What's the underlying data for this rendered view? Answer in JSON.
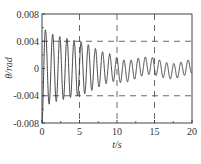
{
  "chart_data": {
    "type": "line",
    "title": "",
    "xlabel": "t/s",
    "ylabel": "θ/rad",
    "xlim": [
      0,
      20
    ],
    "ylim": [
      -0.008,
      0.008
    ],
    "xticks": [
      0,
      5,
      10,
      15,
      20
    ],
    "xtick_labels": [
      "0",
      "5",
      "10",
      "15",
      "20"
    ],
    "yticks": [
      -0.008,
      -0.004,
      0,
      0.004,
      0.008
    ],
    "ytick_labels": [
      "-0.008",
      "-0.004",
      "0",
      "0.004",
      "0.008"
    ],
    "grid": {
      "dashed": true,
      "x": [
        5,
        10,
        15
      ],
      "y": [
        -0.004,
        0.004
      ]
    },
    "legend": null,
    "series": [
      {
        "name": "θ",
        "description": "damped oscillation",
        "initial_value": -0.008,
        "first_peak": 0.0053,
        "period_s": 0.95,
        "amplitude_at_5s": 0.004,
        "amplitude_at_10s": 0.0018,
        "amplitude_at_15s": 0.0012,
        "amplitude_at_20s": 0.001,
        "x": [
          0,
          0.5,
          1.0,
          1.5,
          2.0,
          3.0,
          4.0,
          5.0,
          6.0,
          7.0,
          8.0,
          9.0,
          10.0,
          12.0,
          14.0,
          16.0,
          18.0,
          20.0
        ],
        "envelope": [
          0.008,
          0.0055,
          0.0052,
          0.005,
          0.0048,
          0.0045,
          0.0042,
          0.004,
          0.0036,
          0.003,
          0.0025,
          0.002,
          0.0018,
          0.0015,
          0.0013,
          0.0012,
          0.0011,
          0.001
        ]
      }
    ]
  },
  "colors": {
    "line": "#333333",
    "axis": "#444444",
    "grid": "#444444"
  }
}
